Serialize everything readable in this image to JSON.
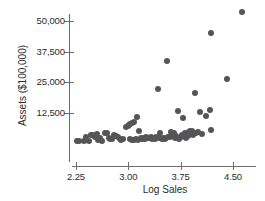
{
  "chart_data": {
    "type": "scatter",
    "title": "",
    "xlabel": "Log Sales",
    "ylabel": "Assets ($100,000)",
    "xlim": [
      2.17,
      4.75
    ],
    "ylim": [
      0,
      56000
    ],
    "xticks": [
      "2.25",
      "3.00",
      "3.75",
      "4.50"
    ],
    "xtick_values": [
      2.25,
      3.0,
      3.75,
      4.5
    ],
    "yticks": [
      "12,500",
      "25,000",
      "37,500",
      "50,000"
    ],
    "ytick_values": [
      12500,
      25000,
      37500,
      50000
    ],
    "grid": false,
    "legend": null,
    "marker_color": "#555558",
    "axis_color": "#6d6d70",
    "points": [
      {
        "x": 2.26,
        "y": 900
      },
      {
        "x": 2.3,
        "y": 900
      },
      {
        "x": 2.36,
        "y": 1100
      },
      {
        "x": 2.4,
        "y": 2700
      },
      {
        "x": 2.43,
        "y": 1200
      },
      {
        "x": 2.47,
        "y": 3600
      },
      {
        "x": 2.5,
        "y": 3500
      },
      {
        "x": 2.52,
        "y": 2600
      },
      {
        "x": 2.55,
        "y": 4000
      },
      {
        "x": 2.57,
        "y": 1500
      },
      {
        "x": 2.6,
        "y": 2500
      },
      {
        "x": 2.62,
        "y": 900
      },
      {
        "x": 2.66,
        "y": 4400
      },
      {
        "x": 2.69,
        "y": 4300
      },
      {
        "x": 2.72,
        "y": 2200
      },
      {
        "x": 2.74,
        "y": 1800
      },
      {
        "x": 2.77,
        "y": 2000
      },
      {
        "x": 2.8,
        "y": 3400
      },
      {
        "x": 2.83,
        "y": 3200
      },
      {
        "x": 2.85,
        "y": 2800
      },
      {
        "x": 2.88,
        "y": 2100
      },
      {
        "x": 2.9,
        "y": 1600
      },
      {
        "x": 2.93,
        "y": 2000
      },
      {
        "x": 2.96,
        "y": 6700
      },
      {
        "x": 2.99,
        "y": 7200
      },
      {
        "x": 3.01,
        "y": 7600
      },
      {
        "x": 3.03,
        "y": 8000
      },
      {
        "x": 3.05,
        "y": 8500
      },
      {
        "x": 3.08,
        "y": 9000
      },
      {
        "x": 3.12,
        "y": 10700
      },
      {
        "x": 3.02,
        "y": 1700
      },
      {
        "x": 3.05,
        "y": 1500
      },
      {
        "x": 3.08,
        "y": 1600
      },
      {
        "x": 3.11,
        "y": 1900
      },
      {
        "x": 3.14,
        "y": 1500
      },
      {
        "x": 3.16,
        "y": 5100
      },
      {
        "x": 3.18,
        "y": 2400
      },
      {
        "x": 3.2,
        "y": 2000
      },
      {
        "x": 3.22,
        "y": 2300
      },
      {
        "x": 3.24,
        "y": 1900
      },
      {
        "x": 3.26,
        "y": 2600
      },
      {
        "x": 3.28,
        "y": 2200
      },
      {
        "x": 3.3,
        "y": 2500
      },
      {
        "x": 3.32,
        "y": 2800
      },
      {
        "x": 3.34,
        "y": 2000
      },
      {
        "x": 3.36,
        "y": 2400
      },
      {
        "x": 3.38,
        "y": 1800
      },
      {
        "x": 3.4,
        "y": 2700
      },
      {
        "x": 3.42,
        "y": 22200
      },
      {
        "x": 3.44,
        "y": 2300
      },
      {
        "x": 3.46,
        "y": 4400
      },
      {
        "x": 3.48,
        "y": 2100
      },
      {
        "x": 3.5,
        "y": 2500
      },
      {
        "x": 3.52,
        "y": 1900
      },
      {
        "x": 3.54,
        "y": 2200
      },
      {
        "x": 3.56,
        "y": 33500
      },
      {
        "x": 3.57,
        "y": 2900
      },
      {
        "x": 3.59,
        "y": 2600
      },
      {
        "x": 3.61,
        "y": 4700
      },
      {
        "x": 3.63,
        "y": 3800
      },
      {
        "x": 3.65,
        "y": 4200
      },
      {
        "x": 3.67,
        "y": 2400
      },
      {
        "x": 3.69,
        "y": 3000
      },
      {
        "x": 3.71,
        "y": 13200
      },
      {
        "x": 3.73,
        "y": 1800
      },
      {
        "x": 3.75,
        "y": 2600
      },
      {
        "x": 3.77,
        "y": 3600
      },
      {
        "x": 3.79,
        "y": 10600
      },
      {
        "x": 3.81,
        "y": 4200
      },
      {
        "x": 3.83,
        "y": 2500
      },
      {
        "x": 3.85,
        "y": 3300
      },
      {
        "x": 3.87,
        "y": 4800
      },
      {
        "x": 3.89,
        "y": 5300
      },
      {
        "x": 3.91,
        "y": 5000
      },
      {
        "x": 3.93,
        "y": 3600
      },
      {
        "x": 3.95,
        "y": 20800
      },
      {
        "x": 3.97,
        "y": 4500
      },
      {
        "x": 4.0,
        "y": 4900
      },
      {
        "x": 4.03,
        "y": 12900
      },
      {
        "x": 4.06,
        "y": 3800
      },
      {
        "x": 4.12,
        "y": 11400
      },
      {
        "x": 4.17,
        "y": 13900
      },
      {
        "x": 4.18,
        "y": 45000
      },
      {
        "x": 4.19,
        "y": 5500
      },
      {
        "x": 4.41,
        "y": 26500
      },
      {
        "x": 4.63,
        "y": 53500
      }
    ]
  }
}
